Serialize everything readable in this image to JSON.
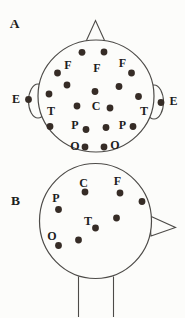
{
  "figure": {
    "description_title": "",
    "colors": {
      "background": "#fcfcfa",
      "line": "#4d4b48",
      "dot": "#362c26",
      "text": "#1d1d1d"
    },
    "dot_radius": 3.4,
    "panels": [
      {
        "id": "A",
        "label": "A",
        "label_pos": [
          14.5,
          23
        ],
        "view": "top-of-head",
        "head": [
          96,
          96,
          58,
          56
        ],
        "nose": [
          [
            86,
            41.5
          ],
          [
            95.5,
            20.5
          ],
          [
            105,
            41.5
          ]
        ],
        "ears": [
          [
            38,
            101,
            9.5,
            17
          ],
          [
            154,
            102,
            9.5,
            17
          ]
        ],
        "neck": [],
        "electrodes": [
          [
            82,
            52.3
          ],
          [
            104,
            52
          ],
          [
            57.5,
            73
          ],
          [
            131.5,
            73
          ],
          [
            67,
            85
          ],
          [
            95,
            91.5
          ],
          [
            119,
            86.5
          ],
          [
            49,
            94
          ],
          [
            138.5,
            96.5
          ],
          [
            77,
            106
          ],
          [
            110,
            108
          ],
          [
            50,
            126.5
          ],
          [
            86,
            129.5
          ],
          [
            106,
            127.5
          ],
          [
            133,
            126.5
          ],
          [
            85,
            147
          ],
          [
            104,
            147
          ]
        ],
        "ear_electrodes": [
          [
            28.5,
            99.5
          ],
          [
            161,
            102.5
          ]
        ],
        "region_labels": [
          {
            "text": "F",
            "x": 68,
            "y": 65
          },
          {
            "text": "F",
            "x": 97,
            "y": 68
          },
          {
            "text": "F",
            "x": 122.5,
            "y": 62.5
          },
          {
            "text": "E",
            "x": 16,
            "y": 98.5
          },
          {
            "text": "E",
            "x": 173.5,
            "y": 101
          },
          {
            "text": "T",
            "x": 51,
            "y": 110.5
          },
          {
            "text": "C",
            "x": 96,
            "y": 105.5
          },
          {
            "text": "T",
            "x": 144,
            "y": 110.5
          },
          {
            "text": "P",
            "x": 75,
            "y": 124.5
          },
          {
            "text": "P",
            "x": 122.5,
            "y": 124.5
          },
          {
            "text": "O",
            "x": 75,
            "y": 145.5
          },
          {
            "text": "O",
            "x": 115,
            "y": 145
          }
        ]
      },
      {
        "id": "B",
        "label": "B",
        "label_pos": [
          15.5,
          200
        ],
        "view": "side-of-head",
        "head": [
          95.5,
          221,
          56,
          57.5
        ],
        "nose": [
          [
            149,
            215.5
          ],
          [
            175.5,
            227.5
          ],
          [
            151,
            236
          ]
        ],
        "ears": [],
        "neck": [
          [
            78.5,
            276.5,
            78.5,
            317
          ],
          [
            113.5,
            276.5,
            113.5,
            317
          ]
        ],
        "electrodes": [
          [
            85,
            192
          ],
          [
            120,
            193
          ],
          [
            58.5,
            209.5
          ],
          [
            142,
            201.5
          ],
          [
            95.5,
            228
          ],
          [
            116.5,
            218
          ],
          [
            78.5,
            240
          ],
          [
            58.5,
            245.5
          ]
        ],
        "ear_electrodes": [],
        "region_labels": [
          {
            "text": "C",
            "x": 83.5,
            "y": 182.5
          },
          {
            "text": "F",
            "x": 117.5,
            "y": 180.5
          },
          {
            "text": "P",
            "x": 56,
            "y": 197.5
          },
          {
            "text": "T",
            "x": 88,
            "y": 220.5
          },
          {
            "text": "O",
            "x": 52,
            "y": 235.5
          }
        ]
      }
    ]
  }
}
